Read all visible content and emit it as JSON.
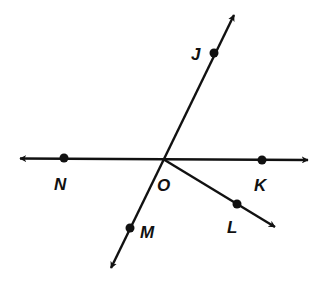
{
  "diagram": {
    "type": "geometry-lines-rays",
    "colors": {
      "stroke": "#111111",
      "background": "#ffffff"
    },
    "points": {
      "O": {
        "label": "O",
        "x": 163,
        "y": 159
      },
      "J": {
        "label": "J",
        "x": 214,
        "y": 53
      },
      "M": {
        "label": "M",
        "x": 130,
        "y": 228
      },
      "N": {
        "label": "N",
        "x": 64,
        "y": 158
      },
      "K": {
        "label": "K",
        "x": 262,
        "y": 160
      },
      "L": {
        "label": "L",
        "x": 237,
        "y": 204
      }
    },
    "lines": [
      {
        "name": "line-NK",
        "through": [
          "N",
          "O",
          "K"
        ],
        "arrows": "both"
      },
      {
        "name": "line-JM",
        "through": [
          "J",
          "O",
          "M"
        ],
        "arrows": "both"
      }
    ],
    "rays": [
      {
        "name": "ray-OL",
        "from": "O",
        "through": "L"
      }
    ]
  }
}
